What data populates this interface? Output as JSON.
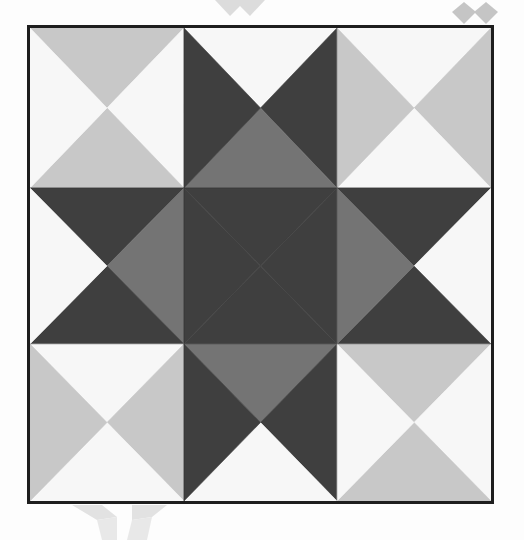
{
  "colors": {
    "white": "#f7f7f7",
    "light": "#c8c8c8",
    "medium": "#747474",
    "dark": "#3f3f3f",
    "border": "#1e1e1e",
    "watermark": "#bdbdbd"
  },
  "grid": {
    "rows": 3,
    "cols": 3,
    "col_edges": [
      0,
      156,
      311,
      467
    ],
    "row_edges": [
      0,
      162,
      320,
      479
    ]
  },
  "cells": [
    {
      "row": 0,
      "col": 0,
      "top": "light",
      "right": "white",
      "bottom": "light",
      "left": "white"
    },
    {
      "row": 0,
      "col": 1,
      "top": "white",
      "right": "dark",
      "bottom": "medium",
      "left": "dark"
    },
    {
      "row": 0,
      "col": 2,
      "top": "white",
      "right": "light",
      "bottom": "white",
      "left": "light"
    },
    {
      "row": 1,
      "col": 0,
      "top": "dark",
      "right": "medium",
      "bottom": "dark",
      "left": "white"
    },
    {
      "row": 1,
      "col": 1,
      "top": "dark",
      "right": "dark",
      "bottom": "dark",
      "left": "dark"
    },
    {
      "row": 1,
      "col": 2,
      "top": "dark",
      "right": "white",
      "bottom": "dark",
      "left": "medium"
    },
    {
      "row": 2,
      "col": 0,
      "top": "white",
      "right": "light",
      "bottom": "white",
      "left": "light"
    },
    {
      "row": 2,
      "col": 1,
      "top": "medium",
      "right": "dark",
      "bottom": "white",
      "left": "dark"
    },
    {
      "row": 2,
      "col": 2,
      "top": "light",
      "right": "white",
      "bottom": "light",
      "left": "white"
    }
  ]
}
